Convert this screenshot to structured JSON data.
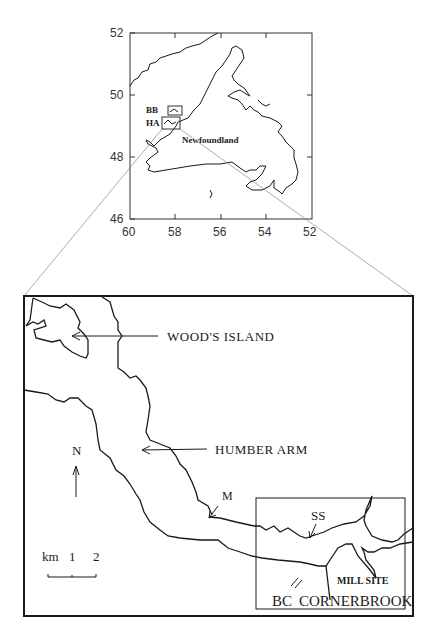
{
  "overview_map": {
    "y_ticks": [
      "52",
      "50",
      "48",
      "46"
    ],
    "x_ticks": [
      "60",
      "58",
      "56",
      "54",
      "52"
    ],
    "region_label": "Newfoundland",
    "box_labels": [
      "BB",
      "HA"
    ]
  },
  "detail_map": {
    "labels": {
      "woods_island": "WOOD'S ISLAND",
      "humber_arm": "HUMBER ARM",
      "north": "N",
      "m": "M",
      "ss": "SS",
      "bc": "BC",
      "cornerbrook": "CORNERBROOK",
      "mill_site": "MILL SITE"
    },
    "scale": {
      "unit": "km",
      "ticks": [
        "1",
        "2"
      ]
    }
  },
  "colors": {
    "ink": "#1a1a1a",
    "leader": "#888888",
    "background": "#ffffff"
  }
}
